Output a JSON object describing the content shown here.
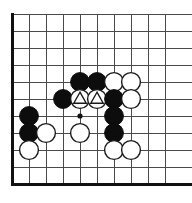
{
  "diagram": {
    "type": "go-board-diagram",
    "board": {
      "origin_x": 12,
      "origin_y": 14,
      "spacing": 17,
      "columns": 10,
      "rows": 11,
      "stone_radius": 9.4,
      "line_color": "#4a4a4a",
      "edge_color": "#111111",
      "background_color": "#ffffff",
      "black_color": "#0d0d0d",
      "white_color": "#ffffff",
      "white_outline_color": "#1a1a1a",
      "edges": [
        {
          "name": "left-border",
          "thick": true
        },
        {
          "name": "bottom-border",
          "thick": true
        }
      ]
    },
    "star_points": [
      {
        "col": 4,
        "row": 6
      }
    ],
    "stones": [
      {
        "col": 4,
        "row": 4,
        "color": "black",
        "mark": "none"
      },
      {
        "col": 5,
        "row": 4,
        "color": "black",
        "mark": "none"
      },
      {
        "col": 6,
        "row": 4,
        "color": "white",
        "mark": "none"
      },
      {
        "col": 7,
        "row": 4,
        "color": "white",
        "mark": "none"
      },
      {
        "col": 3,
        "row": 5,
        "color": "black",
        "mark": "none"
      },
      {
        "col": 4,
        "row": 5,
        "color": "white",
        "mark": "triangle"
      },
      {
        "col": 5,
        "row": 5,
        "color": "white",
        "mark": "triangle"
      },
      {
        "col": 6,
        "row": 5,
        "color": "black",
        "mark": "none"
      },
      {
        "col": 7,
        "row": 5,
        "color": "white",
        "mark": "none"
      },
      {
        "col": 1,
        "row": 6,
        "color": "black",
        "mark": "none"
      },
      {
        "col": 6,
        "row": 6,
        "color": "black",
        "mark": "none"
      },
      {
        "col": 1,
        "row": 7,
        "color": "black",
        "mark": "none"
      },
      {
        "col": 2,
        "row": 7,
        "color": "white",
        "mark": "none"
      },
      {
        "col": 4,
        "row": 7,
        "color": "white",
        "mark": "none"
      },
      {
        "col": 6,
        "row": 7,
        "color": "black",
        "mark": "none"
      },
      {
        "col": 1,
        "row": 8,
        "color": "white",
        "mark": "none"
      },
      {
        "col": 6,
        "row": 8,
        "color": "white",
        "mark": "none"
      },
      {
        "col": 7,
        "row": 8,
        "color": "white",
        "mark": "none"
      }
    ]
  }
}
